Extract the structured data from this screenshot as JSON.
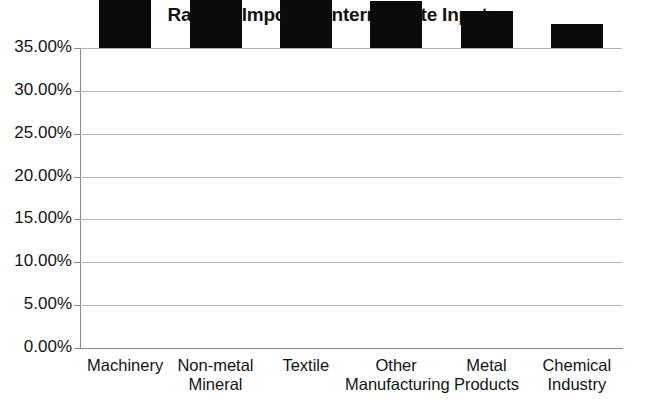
{
  "chart_data": {
    "type": "bar",
    "title": "Ratio of Imported Intermediate Input",
    "xlabel": "",
    "ylabel": "",
    "categories": [
      "Machinery",
      "Non-metal Mineral",
      "Textile",
      "Other Manufacturing",
      "Metal Products",
      "Chemical Industry"
    ],
    "category_lines": [
      [
        "Machinery"
      ],
      [
        "Non-metal",
        "Mineral"
      ],
      [
        "Textile"
      ],
      [
        "Other",
        "Manufacturing"
      ],
      [
        "Metal",
        "Products"
      ],
      [
        "Chemical",
        "Industry"
      ]
    ],
    "values": [
      30.3,
      17.5,
      13.5,
      5.5,
      4.3,
      2.8
    ],
    "value_unit": "%",
    "ylim": [
      0,
      35
    ],
    "ytick_values": [
      0,
      5,
      10,
      15,
      20,
      25,
      30,
      35
    ],
    "ytick_labels": [
      "0.00%",
      "5.00%",
      "10.00%",
      "15.00%",
      "20.00%",
      "25.00%",
      "30.00%",
      "35.00%"
    ],
    "grid": true,
    "grid_axis": "y",
    "legend": false,
    "legend_position": "none",
    "bar_color": "#0b0b0b",
    "gridline_color": "#b4b4b4",
    "axis_color": "#8a8a8a",
    "background_color": "#ffffff"
  }
}
